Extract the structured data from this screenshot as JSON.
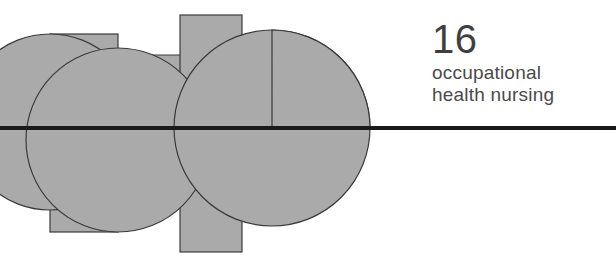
{
  "page": {
    "kind": "book-chapter-divider",
    "width": 616,
    "height": 261,
    "background_color": "#ffffff"
  },
  "title_block": {
    "chapter_number": "16",
    "title_line_1": "occupational",
    "title_line_2": "health nursing",
    "text_color": "#3f3f3f"
  },
  "artwork": {
    "name": "abstract-geometric-composition",
    "fill_color": "#aaaaaa",
    "stroke_color": "#3a3a3a",
    "rule_color": "#1a1a1a",
    "rule": {
      "y": 128,
      "thickness": 4,
      "x_start": 0,
      "x_end": 616
    },
    "shapes": [
      {
        "name": "rect-left-wide",
        "type": "rect",
        "x": 0,
        "y": 55,
        "width": 190,
        "height": 80
      },
      {
        "name": "rect-mid-tall",
        "type": "rect",
        "x": 50,
        "y": 34,
        "width": 68,
        "height": 198
      },
      {
        "name": "rect-right-tall",
        "type": "rect",
        "x": 180,
        "y": 15,
        "width": 62,
        "height": 237
      },
      {
        "name": "circle-left",
        "type": "circle",
        "cx": 50,
        "cy": 122,
        "r": 88
      },
      {
        "name": "circle-center",
        "type": "circle",
        "cx": 118,
        "cy": 140,
        "r": 92
      },
      {
        "name": "circle-right-large",
        "type": "circle",
        "cx": 272,
        "cy": 128,
        "r": 98
      },
      {
        "name": "quarter-circle-upper-right",
        "type": "quarter-circle",
        "cx": 272,
        "cy": 128,
        "r": 98
      }
    ]
  }
}
